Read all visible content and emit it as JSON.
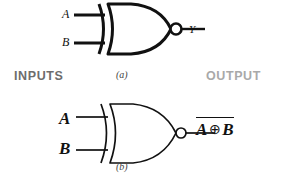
{
  "figure": {
    "background_color": "#ffffff",
    "line_color": "#111111"
  },
  "headings": {
    "inputs": "INPUTS",
    "inputs_color": "#6d6d6d",
    "output": "OUTPUT",
    "output_color": "#a9a9a9"
  },
  "gates": [
    {
      "caption": "(a)",
      "type": "XNOR",
      "stroke_width": 3,
      "inputs": [
        {
          "label": "A"
        },
        {
          "label": "B"
        }
      ],
      "output": {
        "label": "Y",
        "inverted": true
      }
    },
    {
      "caption": "(b)",
      "type": "XNOR",
      "stroke_width": 1.6,
      "inputs": [
        {
          "label": "A"
        },
        {
          "label": "B"
        }
      ],
      "output": {
        "label": "A ⊕ B",
        "overbar": true,
        "operand_left": "A",
        "operator": "⊕",
        "operand_right": "B",
        "inverted": true
      }
    }
  ]
}
